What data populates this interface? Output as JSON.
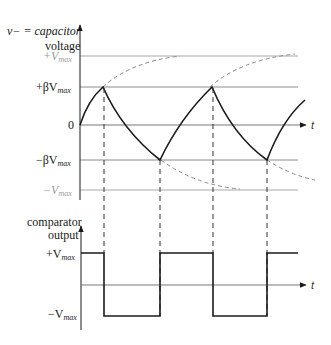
{
  "diagram": {
    "top_plot": {
      "ylabel_line1": "v− = capacitor",
      "ylabel_line2": "voltage",
      "levels": [
        {
          "key": "pos_vmax",
          "prefix": "+V",
          "sub": "max",
          "color": "#9a9a9a"
        },
        {
          "key": "pos_beta_vmax",
          "prefix": "+βV",
          "sub": "max",
          "color": "#1a1a1a"
        },
        {
          "key": "zero",
          "prefix": "0",
          "sub": "",
          "color": "#1a1a1a"
        },
        {
          "key": "neg_beta_vmax",
          "prefix": "−βV",
          "sub": "max",
          "color": "#1a1a1a"
        },
        {
          "key": "neg_vmax",
          "prefix": "−V",
          "sub": "max",
          "color": "#9a9a9a"
        }
      ],
      "time_label": "t",
      "description": "Capacitor voltage exponentially charges/discharges between +βVmax and −βVmax; dashed curves show exponential asymptotes toward ±Vmax"
    },
    "bottom_plot": {
      "ylabel_line1": "comparator",
      "ylabel_line2": "output",
      "levels": [
        {
          "key": "pos_vmax",
          "prefix": "+V",
          "sub": "max"
        },
        {
          "key": "neg_vmax",
          "prefix": "−V",
          "sub": "max"
        }
      ],
      "time_label": "t",
      "sequence": [
        "+Vmax",
        "−Vmax",
        "+Vmax",
        "−Vmax",
        "+Vmax"
      ]
    },
    "colors": {
      "waveform": "#1a1a1a",
      "reference_line": "#9a9a9a",
      "dashed": "#8a8a8a"
    }
  }
}
